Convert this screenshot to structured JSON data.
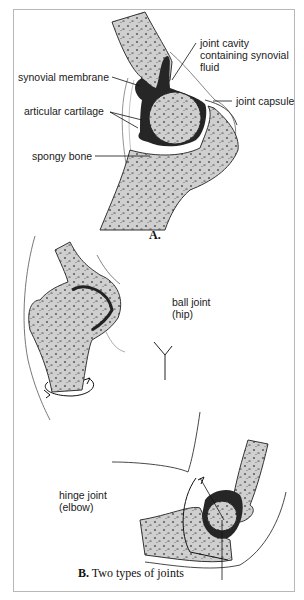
{
  "figure_a": {
    "caption": "A.",
    "labels": {
      "joint_cavity": "joint cavity\ncontaining synovial\nfluid",
      "synovial_membrane": "synovial membrane",
      "joint_capsule": "joint capsule",
      "articular_cartilage": "articular cartilage",
      "spongy_bone": "spongy bone"
    }
  },
  "figure_b": {
    "caption_bold": "B.",
    "caption_text": " Two types of joints",
    "labels": {
      "ball_joint": "ball joint\n(hip)",
      "hinge_joint": "hinge joint\n(elbow)"
    }
  },
  "colors": {
    "bone": "#c9c9c9",
    "cartilage": "#2a2a2a",
    "outline": "#333333",
    "frame": "#b8b8b8"
  }
}
